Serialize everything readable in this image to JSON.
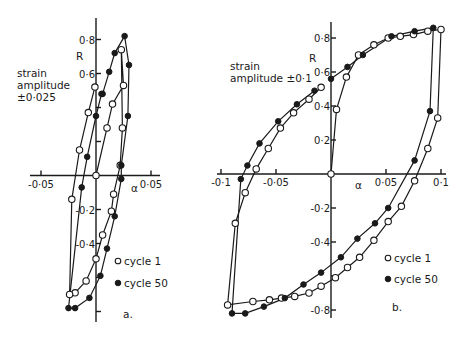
{
  "chart_data": [
    {
      "type": "scatter",
      "panel": "a.",
      "annotation": "strain amplitude ±0·025",
      "xlabel": "α",
      "ylabel": "R",
      "xlim": [
        -0.055,
        0.055
      ],
      "ylim": [
        -0.86,
        0.86
      ],
      "x_ticks": [
        {
          "v": -0.05,
          "label": "-0·05"
        },
        {
          "v": 0,
          "label": ""
        },
        {
          "v": 0.05,
          "label": "0·05"
        }
      ],
      "y_ticks": [
        {
          "v": 0.8,
          "label": "0·8"
        },
        {
          "v": 0.6,
          "label": "0·6"
        },
        {
          "v": 0.4,
          "label": ""
        },
        {
          "v": 0.2,
          "label": ""
        },
        {
          "v": -0.2,
          "label": "-0·2"
        },
        {
          "v": -0.4,
          "label": "-0·4"
        },
        {
          "v": -0.6,
          "label": ""
        },
        {
          "v": -0.8,
          "label": ""
        }
      ],
      "legend": [
        {
          "name": "cycle 1",
          "marker": "open"
        },
        {
          "name": "cycle 50",
          "marker": "filled"
        }
      ],
      "series": [
        {
          "name": "cycle 1",
          "marker": "open",
          "points": [
            [
              0.0,
              0.0
            ],
            [
              0.01,
              0.28
            ],
            [
              0.015,
              0.42
            ],
            [
              0.025,
              0.53
            ],
            [
              0.023,
              0.74
            ],
            [
              0.024,
              0.28
            ],
            [
              0.022,
              0.06
            ],
            [
              0.016,
              -0.11
            ],
            [
              0.014,
              -0.21
            ],
            [
              0.006,
              -0.35
            ],
            [
              0.0,
              -0.49
            ],
            [
              -0.009,
              -0.62
            ],
            [
              -0.019,
              -0.69
            ],
            [
              -0.024,
              -0.7
            ],
            [
              -0.022,
              -0.14
            ],
            [
              -0.015,
              0.15
            ],
            [
              -0.007,
              0.37
            ],
            [
              -0.001,
              0.52
            ]
          ]
        },
        {
          "name": "cycle 50",
          "marker": "filled",
          "points": [
            [
              0.006,
              0.48
            ],
            [
              0.012,
              0.61
            ],
            [
              0.017,
              0.72
            ],
            [
              0.026,
              0.82
            ],
            [
              0.03,
              0.65
            ],
            [
              0.029,
              0.35
            ],
            [
              0.023,
              0.06
            ],
            [
              0.023,
              -0.02
            ],
            [
              0.017,
              -0.24
            ],
            [
              0.01,
              -0.43
            ],
            [
              0.004,
              -0.59
            ],
            [
              -0.006,
              -0.72
            ],
            [
              -0.019,
              -0.78
            ],
            [
              -0.025,
              -0.78
            ],
            [
              -0.013,
              -0.07
            ],
            [
              -0.008,
              0.11
            ],
            [
              0.0,
              0.35
            ],
            [
              0.005,
              0.48
            ]
          ]
        }
      ]
    },
    {
      "type": "scatter",
      "panel": "b.",
      "annotation": "strain amplitude ±0·1",
      "xlabel": "α",
      "ylabel": "R",
      "xlim": [
        -0.105,
        0.105
      ],
      "ylim": [
        -0.86,
        0.86
      ],
      "x_ticks": [
        {
          "v": -0.1,
          "label": "-0·1"
        },
        {
          "v": -0.05,
          "label": "-0·05"
        },
        {
          "v": 0.05,
          "label": "0·05"
        },
        {
          "v": 0.1,
          "label": "0·1"
        }
      ],
      "y_ticks": [
        {
          "v": 0.8,
          "label": "0·8"
        },
        {
          "v": 0.6,
          "label": "0·6"
        },
        {
          "v": 0.4,
          "label": "0·4"
        },
        {
          "v": 0.2,
          "label": "0·2"
        },
        {
          "v": -0.2,
          "label": "-0·2"
        },
        {
          "v": -0.4,
          "label": "-0·4"
        },
        {
          "v": -0.6,
          "label": ""
        },
        {
          "v": -0.8,
          "label": "-0·8"
        }
      ],
      "legend": [
        {
          "name": "cycle 1",
          "marker": "open"
        },
        {
          "name": "cycle 50",
          "marker": "filled"
        }
      ],
      "series": [
        {
          "name": "cycle 1",
          "marker": "open",
          "points": [
            [
              0.0,
              0.0
            ],
            [
              0.005,
              0.38
            ],
            [
              0.014,
              0.57
            ],
            [
              0.025,
              0.7
            ],
            [
              0.039,
              0.76
            ],
            [
              0.052,
              0.8
            ],
            [
              0.063,
              0.81
            ],
            [
              0.075,
              0.82
            ],
            [
              0.088,
              0.84
            ],
            [
              0.1,
              0.85
            ],
            [
              0.097,
              0.33
            ],
            [
              0.088,
              0.15
            ],
            [
              0.076,
              -0.04
            ],
            [
              0.064,
              -0.19
            ],
            [
              0.052,
              -0.28
            ],
            [
              0.039,
              -0.39
            ],
            [
              0.026,
              -0.49
            ],
            [
              0.015,
              -0.55
            ],
            [
              0.004,
              -0.61
            ],
            [
              -0.009,
              -0.66
            ],
            [
              -0.02,
              -0.7
            ],
            [
              -0.033,
              -0.72
            ],
            [
              -0.045,
              -0.73
            ],
            [
              -0.056,
              -0.74
            ],
            [
              -0.071,
              -0.75
            ],
            [
              -0.094,
              -0.77
            ],
            [
              -0.087,
              -0.29
            ],
            [
              -0.078,
              -0.11
            ],
            [
              -0.068,
              0.03
            ],
            [
              -0.057,
              0.15
            ],
            [
              -0.046,
              0.27
            ],
            [
              -0.034,
              0.36
            ],
            [
              -0.02,
              0.44
            ],
            [
              -0.009,
              0.51
            ]
          ]
        },
        {
          "name": "cycle 50",
          "marker": "filled",
          "points": [
            [
              0.0,
              0.56
            ],
            [
              0.015,
              0.63
            ],
            [
              0.029,
              0.7
            ],
            [
              0.055,
              0.81
            ],
            [
              0.076,
              0.84
            ],
            [
              0.093,
              0.86
            ],
            [
              0.09,
              0.37
            ],
            [
              0.076,
              0.08
            ],
            [
              0.052,
              -0.2
            ],
            [
              0.04,
              -0.29
            ],
            [
              0.024,
              -0.38
            ],
            [
              0.009,
              -0.49
            ],
            [
              -0.009,
              -0.58
            ],
            [
              -0.025,
              -0.65
            ],
            [
              -0.042,
              -0.73
            ],
            [
              -0.061,
              -0.78
            ],
            [
              -0.078,
              -0.82
            ],
            [
              -0.09,
              -0.82
            ],
            [
              -0.082,
              -0.03
            ],
            [
              -0.076,
              0.05
            ],
            [
              -0.065,
              0.18
            ],
            [
              -0.048,
              0.31
            ],
            [
              -0.031,
              0.41
            ],
            [
              -0.015,
              0.49
            ]
          ]
        }
      ]
    }
  ],
  "panels": {
    "a": {
      "label": "a.",
      "annotation_lines": [
        "strain",
        "amplitude",
        "±0·025"
      ],
      "xlabel": "α",
      "ylabel": "R",
      "legend_cycle1": "cycle 1",
      "legend_cycle50": "cycle 50"
    },
    "b": {
      "label": "b.",
      "annotation_lines": [
        "strain",
        "amplitude ±0·1"
      ],
      "xlabel": "α",
      "ylabel": "R",
      "legend_cycle1": "cycle 1",
      "legend_cycle50": "cycle 50"
    }
  },
  "colors": {
    "ink": "#1a1a1a",
    "background": "#ffffff"
  }
}
